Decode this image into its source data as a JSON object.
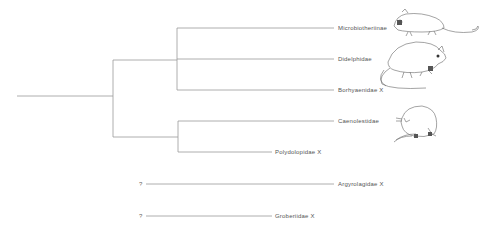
{
  "diagram": {
    "type": "cladogram",
    "colors": {
      "line": "#9a9a9a",
      "text": "#555555",
      "drawing": "#666666"
    },
    "taxa": [
      {
        "id": "microbiotheriinae",
        "label": "Microbiotheriinae",
        "extinct": false,
        "illustrated": true
      },
      {
        "id": "didelphidae",
        "label": "Didelphidae",
        "extinct": false,
        "illustrated": true
      },
      {
        "id": "borhyaenidae",
        "label": "Borhyaenidae X",
        "extinct": true,
        "illustrated": false
      },
      {
        "id": "caenolestidae",
        "label": "Caenolestidae",
        "extinct": false,
        "illustrated": true
      },
      {
        "id": "polydolopidae",
        "label": "Polydolopidae X",
        "extinct": true,
        "illustrated": false
      },
      {
        "id": "argyrolagidae",
        "label": "Argyrolagidae X",
        "extinct": true,
        "illustrated": false,
        "uncertain_marker": "?"
      },
      {
        "id": "groberiidae",
        "label": "Groberiidae X",
        "extinct": true,
        "illustrated": false,
        "uncertain_marker": "?"
      }
    ],
    "uncertain_marker": "?"
  }
}
